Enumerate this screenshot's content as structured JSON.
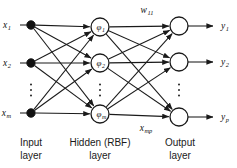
{
  "diagram": {
    "type": "neural-network-diagram",
    "colors": {
      "line": "#1a1a1a",
      "input_node_fill": "#111111",
      "hidden_node_fill": "#ffffff",
      "output_node_fill": "#ffffff",
      "background": "#ffffff",
      "text": "#1a1a1a"
    },
    "layers": [
      {
        "id": "input",
        "caption_line1": "Input",
        "caption_line2": "layer",
        "node_style": "filled",
        "nodes": [
          {
            "label_base": "x",
            "label_sub": "1",
            "cx": 31,
            "cy": 25,
            "r": 4.2
          },
          {
            "label_base": "x",
            "label_sub": "2",
            "cx": 31,
            "cy": 63,
            "r": 4.2
          },
          {
            "label_base": "x",
            "label_sub": "m",
            "cx": 31,
            "cy": 113,
            "r": 4.2
          }
        ],
        "ellipsis": {
          "cx": 31,
          "cy": 90,
          "count": 3
        }
      },
      {
        "id": "hidden",
        "caption_line1": "Hidden (RBF)",
        "caption_line2": "layer",
        "node_style": "open",
        "nodes": [
          {
            "label_base": "φ",
            "label_sub": "1",
            "cx": 100,
            "cy": 27,
            "r": 9
          },
          {
            "label_base": "φ",
            "label_sub": "2",
            "cx": 100,
            "cy": 63,
            "r": 9
          },
          {
            "label_base": "φ",
            "label_sub": "m",
            "cx": 100,
            "cy": 114,
            "r": 9
          }
        ],
        "ellipsis": {
          "cx": 100,
          "cy": 90,
          "count": 3
        }
      },
      {
        "id": "output",
        "caption_line1": "Output",
        "caption_line2": "layer",
        "node_style": "open",
        "nodes": [
          {
            "label_base": "y",
            "label_sub": "1",
            "cx": 179,
            "cy": 26,
            "r": 9
          },
          {
            "label_base": "y",
            "label_sub": "2",
            "cx": 179,
            "cy": 62,
            "r": 9
          },
          {
            "label_base": "y",
            "label_sub": "p",
            "cx": 179,
            "cy": 117,
            "r": 9
          }
        ],
        "ellipsis": {
          "cx": 179,
          "cy": 90,
          "count": 3
        }
      }
    ],
    "input_labels": [
      {
        "base": "x",
        "sub": "1",
        "x": 11,
        "y": 28
      },
      {
        "base": "x",
        "sub": "2",
        "x": 11,
        "y": 66
      },
      {
        "base": "x",
        "sub": "m",
        "x": 11,
        "y": 116
      }
    ],
    "output_labels": [
      {
        "base": "y",
        "sub": "1",
        "x": 221,
        "y": 29
      },
      {
        "base": "y",
        "sub": "2",
        "x": 221,
        "y": 65
      },
      {
        "base": "y",
        "sub": "p",
        "x": 221,
        "y": 120
      }
    ],
    "annotations": [
      {
        "id": "weight-label",
        "base": "w",
        "sub": "11",
        "x": 147,
        "y": 13
      },
      {
        "id": "xmp-label",
        "base": "x",
        "sub": "mp",
        "x": 146,
        "y": 131
      }
    ],
    "captions": [
      {
        "id": "input-caption",
        "line1": "Input",
        "line2": "layer",
        "center_x": 31,
        "top_y": 137
      },
      {
        "id": "hidden-caption",
        "line1": "Hidden (RBF)",
        "line2": "layer",
        "center_x": 100,
        "top_y": 137
      },
      {
        "id": "output-caption",
        "line1": "Output",
        "line2": "layer",
        "center_x": 180,
        "top_y": 137
      }
    ],
    "connections": {
      "input_to_hidden": "fully-connected",
      "hidden_to_output": "fully-connected",
      "input_stubs": "arrow into each input node from left label",
      "output_stubs": "arrow out of each output node to right label"
    }
  }
}
